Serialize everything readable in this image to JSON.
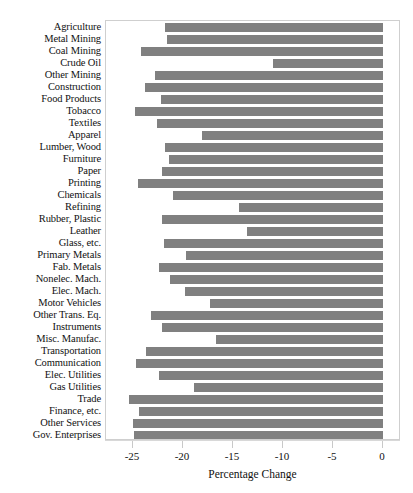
{
  "chart_data": {
    "type": "bar",
    "orientation": "horizontal",
    "title": "",
    "xlabel": "Percentage Change",
    "ylabel": "",
    "xlim": [
      -27.5,
      2
    ],
    "xticks": [
      -25,
      -20,
      -15,
      -10,
      -5,
      0
    ],
    "xtick_labels": [
      "-25",
      "-20",
      "-15",
      "-10",
      "-5",
      "0"
    ],
    "grid": false,
    "legend": null,
    "bar_color": "#808080",
    "categories": [
      "Agriculture",
      "Metal Mining",
      "Coal Mining",
      "Crude Oil",
      "Other Mining",
      "Construction",
      "Food Products",
      "Tobacco",
      "Textiles",
      "Apparel",
      "Lumber, Wood",
      "Furniture",
      "Paper",
      "Printing",
      "Chemicals",
      "Refining",
      "Rubber, Plastic",
      "Leather",
      "Glass, etc.",
      "Primary Metals",
      "Fab. Metals",
      "Nonelec. Mach.",
      "Elec. Mach.",
      "Motor Vehicles",
      "Other Trans. Eq.",
      "Instruments",
      "Misc. Manufac.",
      "Transportation",
      "Communication",
      "Elec. Utilities",
      "Gas Utilities",
      "Trade",
      "Finance, etc.",
      "Other Services",
      "Gov. Enterprises"
    ],
    "values": [
      -21.8,
      -21.6,
      -24.2,
      -11.0,
      -22.8,
      -23.8,
      -22.2,
      -24.8,
      -22.6,
      -18.1,
      -21.8,
      -21.4,
      -22.1,
      -24.5,
      -21.0,
      -14.4,
      -22.1,
      -13.6,
      -21.9,
      -19.7,
      -22.4,
      -21.3,
      -19.8,
      -17.3,
      -23.2,
      -22.1,
      -16.7,
      -23.7,
      -24.7,
      -22.4,
      -18.9,
      -25.4,
      -24.4,
      -25.0,
      -24.9
    ]
  },
  "axis": {
    "x_title": "Percentage Change"
  }
}
